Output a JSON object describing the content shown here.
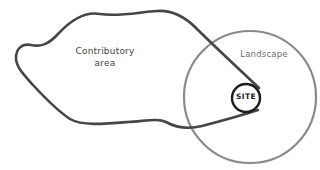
{
  "diagram": {
    "background_color": "#ffffff",
    "width": 320,
    "height": 170,
    "shapes": {
      "contributory_blob": {
        "name": "contributory-area-outline",
        "style": "irregular closed hand-drawn blob",
        "stroke_color": "#454545",
        "stroke_width": 2.6,
        "fill": "none"
      },
      "landscape_circle": {
        "name": "landscape-circle",
        "style": "large circle, clipped at right edge of frame",
        "stroke_color": "#8a8a8a",
        "stroke_width": 2.2,
        "fill": "none",
        "center_x": 250,
        "center_y": 97,
        "radius": 66
      },
      "site_circle": {
        "name": "site-circle",
        "style": "small circle",
        "stroke_color": "#1c1c1c",
        "stroke_width": 2.4,
        "fill": "none",
        "center_x": 246,
        "center_y": 98,
        "radius": 14
      }
    },
    "labels": {
      "contributory_line1": "Contributory",
      "contributory_line2": "area",
      "landscape": "Landscape",
      "site": "SITE"
    }
  }
}
